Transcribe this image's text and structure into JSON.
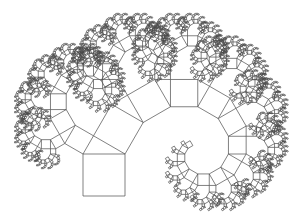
{
  "figure": {
    "background": "#ffffff",
    "stroke_color": "#4a4a4a",
    "base_square": {
      "x": 83,
      "y": 154,
      "side": 42
    },
    "split_angle_deg": 60,
    "max_depth": 14,
    "min_side": 1.2
  }
}
